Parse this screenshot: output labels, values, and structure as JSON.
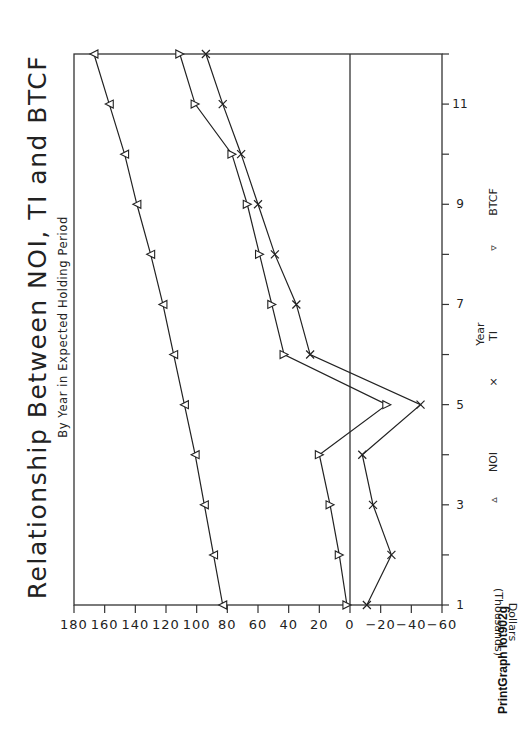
{
  "chart_data": {
    "type": "line",
    "orientation": "rotated 90deg counter-clockwise on page",
    "title": "Relationship Between NOI, TI and BTCF",
    "subtitle": "By Year in Expected Holding Period",
    "xlabel": "Year",
    "ylabel": "Dollars (Thousands)",
    "x": [
      1,
      2,
      3,
      4,
      5,
      6,
      7,
      8,
      9,
      10,
      11,
      12
    ],
    "xlim": [
      1,
      12
    ],
    "xticks": [
      1,
      2,
      3,
      4,
      5,
      6,
      7,
      8,
      9,
      10,
      11,
      12
    ],
    "xtick_labels": [
      "1",
      "",
      "3",
      "",
      "5",
      "",
      "7",
      "",
      "9",
      "",
      "11",
      ""
    ],
    "ylim": [
      -60,
      180
    ],
    "yticks": [
      180,
      160,
      140,
      120,
      100,
      80,
      60,
      40,
      20,
      0,
      -20,
      -40,
      -60
    ],
    "ytick_labels": [
      "180",
      "160",
      "140",
      "120",
      "100",
      "80",
      "60",
      "40",
      "20",
      "0",
      "−20",
      "−40",
      "−60"
    ],
    "zero_line": true,
    "grid": false,
    "legend_position": "below x-axis",
    "series": [
      {
        "name": "NOI",
        "marker": "triangle-up",
        "values": [
          83,
          89,
          95,
          101,
          108,
          115,
          122,
          130,
          139,
          147,
          157,
          167
        ]
      },
      {
        "name": "TI",
        "marker": "x",
        "values": [
          -11,
          -27,
          -15,
          -8,
          -46,
          26,
          35,
          49,
          60,
          71,
          83,
          94
        ]
      },
      {
        "name": "BTCF",
        "marker": "triangle-down",
        "values": [
          2,
          7,
          13,
          20,
          -24,
          43,
          51,
          59,
          67,
          77,
          101,
          111
        ]
      }
    ]
  },
  "legend": {
    "noi_symbol": "▵",
    "noi_label": "NOI",
    "ti_symbol": "×",
    "ti_label": "TI",
    "btcf_symbol": "▿",
    "btcf_label": "BTCF"
  },
  "footer": "PrintGraph lot902g"
}
